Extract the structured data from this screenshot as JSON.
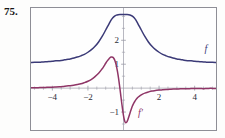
{
  "problem": {
    "number": "75."
  },
  "figure": {
    "frame_border_color": "#8e8e96",
    "background_color": "#fefefe"
  },
  "chart_data": {
    "type": "line",
    "title": "",
    "subtitle": "",
    "xlabel": "",
    "ylabel": "",
    "xlim": [
      -5.2,
      5.2
    ],
    "ylim": [
      -1.75,
      3.35
    ],
    "grid": false,
    "axes": {
      "x_axis_at_y": 0,
      "y_axis_at_x": 0,
      "axis_color": "#9a9aa6",
      "tick_color": "#9a9aa6"
    },
    "xticks": [
      -4,
      -2,
      2,
      4
    ],
    "xtick_labels": [
      "−4",
      "−2",
      "2",
      "4"
    ],
    "xticks_minor": [
      -5,
      -4.5,
      -3.5,
      -3,
      -2.5,
      -1.5,
      -1,
      -0.5,
      0.5,
      1,
      1.5,
      2.5,
      3,
      3.5,
      4.5,
      5
    ],
    "yticks": [
      -1,
      1,
      2
    ],
    "ytick_labels": [
      "−1",
      "1",
      "2"
    ],
    "yticks_minor": [
      -1.5,
      -0.5,
      0.5,
      1.5,
      2.5,
      3
    ],
    "legend_position": "inline-annotations",
    "annotations": [
      {
        "text": "f",
        "x": 4.55,
        "y": 1.52,
        "color": "#3b3a77",
        "name": "curve-label-f"
      },
      {
        "text": "f′",
        "x": 0.82,
        "y": -1.18,
        "color": "#8f3566",
        "name": "curve-label-f-prime"
      }
    ],
    "series": [
      {
        "name": "f",
        "color": "#3b3a77",
        "width": 1.5,
        "x": [
          -5.2,
          -5.0,
          -4.8,
          -4.6,
          -4.4,
          -4.2,
          -4.0,
          -3.8,
          -3.6,
          -3.4,
          -3.2,
          -3.0,
          -2.8,
          -2.6,
          -2.4,
          -2.2,
          -2.0,
          -1.8,
          -1.6,
          -1.4,
          -1.2,
          -1.0,
          -0.9,
          -0.8,
          -0.7,
          -0.6,
          -0.5,
          -0.4,
          -0.3,
          -0.2,
          -0.1,
          0.0,
          0.1,
          0.2,
          0.3,
          0.4,
          0.5,
          0.6,
          0.7,
          0.8,
          0.9,
          1.0,
          1.2,
          1.4,
          1.6,
          1.8,
          2.0,
          2.2,
          2.4,
          2.6,
          2.8,
          3.0,
          3.2,
          3.4,
          3.6,
          3.8,
          4.0,
          4.2,
          4.4,
          4.6,
          4.8,
          5.0,
          5.2
        ],
        "y": [
          1.07,
          1.08,
          1.08,
          1.09,
          1.1,
          1.11,
          1.12,
          1.14,
          1.15,
          1.17,
          1.2,
          1.22,
          1.26,
          1.3,
          1.35,
          1.41,
          1.5,
          1.61,
          1.75,
          1.93,
          2.16,
          2.43,
          2.57,
          2.71,
          2.84,
          2.94,
          3.01,
          3.05,
          3.07,
          3.08,
          3.08,
          3.08,
          3.08,
          3.08,
          3.07,
          3.05,
          3.01,
          2.94,
          2.84,
          2.71,
          2.57,
          2.43,
          2.16,
          1.93,
          1.75,
          1.61,
          1.5,
          1.41,
          1.35,
          1.3,
          1.26,
          1.22,
          1.2,
          1.17,
          1.15,
          1.14,
          1.12,
          1.11,
          1.1,
          1.09,
          1.08,
          1.08,
          1.07
        ]
      },
      {
        "name": "f prime",
        "color": "#8f3566",
        "width": 1.5,
        "x": [
          -5.2,
          -5.0,
          -4.8,
          -4.6,
          -4.4,
          -4.2,
          -4.0,
          -3.8,
          -3.6,
          -3.4,
          -3.2,
          -3.0,
          -2.8,
          -2.6,
          -2.4,
          -2.2,
          -2.0,
          -1.8,
          -1.6,
          -1.4,
          -1.2,
          -1.1,
          -1.0,
          -0.9,
          -0.8,
          -0.7,
          -0.6,
          -0.55,
          -0.5,
          -0.45,
          -0.4,
          -0.35,
          -0.3,
          -0.25,
          -0.2,
          -0.15,
          -0.1,
          -0.05,
          0.0,
          0.05,
          0.1,
          0.15,
          0.2,
          0.25,
          0.3,
          0.35,
          0.4,
          0.45,
          0.5,
          0.55,
          0.6,
          0.7,
          0.8,
          0.9,
          1.0,
          1.1,
          1.2,
          1.4,
          1.6,
          1.8,
          2.0,
          2.2,
          2.4,
          2.6,
          2.8,
          3.0,
          3.2,
          3.4,
          3.6,
          3.8,
          4.0,
          4.2,
          4.4,
          4.6,
          4.8,
          5.0,
          5.2
        ],
        "y": [
          0.02,
          0.02,
          0.02,
          0.03,
          0.03,
          0.04,
          0.04,
          0.05,
          0.06,
          0.07,
          0.09,
          0.1,
          0.12,
          0.15,
          0.18,
          0.23,
          0.29,
          0.37,
          0.48,
          0.62,
          0.81,
          0.92,
          1.04,
          1.15,
          1.24,
          1.3,
          1.29,
          1.25,
          1.18,
          1.07,
          0.93,
          0.74,
          0.52,
          0.26,
          -0.02,
          -0.32,
          -0.62,
          -0.9,
          -1.15,
          -1.33,
          -1.43,
          -1.44,
          -1.4,
          -1.31,
          -1.2,
          -1.08,
          -0.96,
          -0.85,
          -0.75,
          -0.67,
          -0.6,
          -0.48,
          -0.39,
          -0.33,
          -0.28,
          -0.24,
          -0.21,
          -0.16,
          -0.12,
          -0.1,
          -0.08,
          -0.07,
          -0.06,
          -0.05,
          -0.04,
          -0.04,
          -0.03,
          -0.03,
          -0.03,
          -0.02,
          -0.02,
          -0.02,
          -0.02,
          -0.02,
          -0.01,
          -0.01,
          -0.01
        ]
      }
    ]
  }
}
